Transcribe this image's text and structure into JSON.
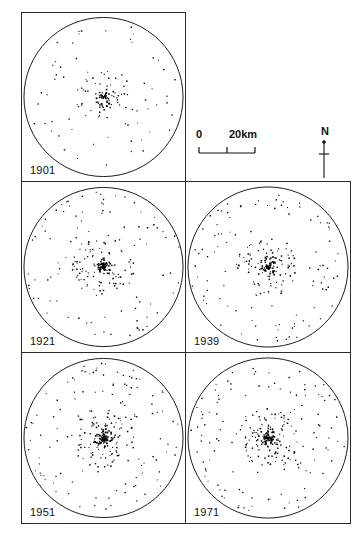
{
  "figure": {
    "background": "#ffffff",
    "ink": "#000000"
  },
  "panels": [
    {
      "year": "1901",
      "row": 0,
      "col": 0,
      "dot_count": 150
    },
    {
      "year": "1921",
      "row": 1,
      "col": 0,
      "dot_count": 250
    },
    {
      "year": "1939",
      "row": 1,
      "col": 1,
      "dot_count": 260
    },
    {
      "year": "1951",
      "row": 2,
      "col": 0,
      "dot_count": 290
    },
    {
      "year": "1971",
      "row": 2,
      "col": 1,
      "dot_count": 300
    }
  ],
  "scale_bar": {
    "min_label": "0",
    "max_label": "20km",
    "ticks": 3,
    "length_km": 20
  },
  "north_arrow": {
    "label": "N"
  },
  "chart_data": {
    "type": "scatter",
    "xlabel": "",
    "ylabel": "",
    "grid": false,
    "legend": "none",
    "panel_shape": "circle inscribed in square",
    "scale_bar_km": 20,
    "north_direction": "up",
    "series": [
      {
        "name": "1901",
        "n_points": 150,
        "radial_spread": 0.62,
        "core_fraction": 0.3
      },
      {
        "name": "1921",
        "n_points": 250,
        "radial_spread": 0.7,
        "core_fraction": 0.3
      },
      {
        "name": "1939",
        "n_points": 260,
        "radial_spread": 0.72,
        "core_fraction": 0.29
      },
      {
        "name": "1951",
        "n_points": 290,
        "radial_spread": 0.76,
        "core_fraction": 0.28
      },
      {
        "name": "1971",
        "n_points": 300,
        "radial_spread": 0.78,
        "core_fraction": 0.28
      }
    ],
    "categories": [
      "1901",
      "1921",
      "1939",
      "1951",
      "1971"
    ],
    "values": [
      150,
      250,
      260,
      290,
      300
    ]
  }
}
